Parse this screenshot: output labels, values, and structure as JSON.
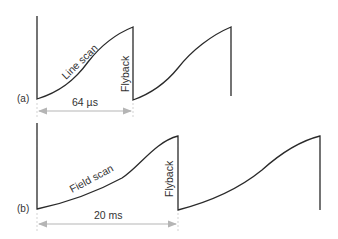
{
  "diagram": {
    "panel_a": {
      "label": "(a)",
      "scan_label": "Line scan",
      "flyback_label": "Flyback",
      "period_label": "64 µs"
    },
    "panel_b": {
      "label": "(b)",
      "scan_label": "Field scan",
      "flyback_label": "Flyback",
      "period_label": "20 ms"
    },
    "colors": {
      "waveform": "#2a2a2a",
      "arrow": "#b5b5b5",
      "text": "#333333"
    }
  }
}
